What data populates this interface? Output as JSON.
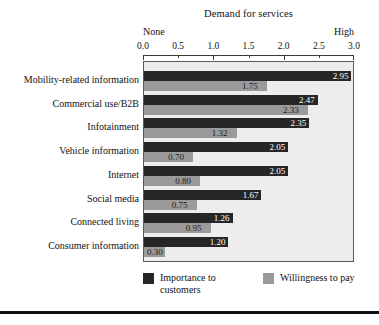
{
  "chart_data": {
    "type": "bar",
    "orientation": "horizontal",
    "title": "Demand for services",
    "xlabel": "",
    "ylabel": "",
    "xlim": [
      0.0,
      3.0
    ],
    "xticks": [
      "0.0",
      "0.5",
      "1.0",
      "1.5",
      "2.0",
      "2.5",
      "3.0"
    ],
    "xtick_values": [
      0.0,
      0.5,
      1.0,
      1.5,
      2.0,
      2.5,
      3.0
    ],
    "scale_low_label": "None",
    "scale_high_label": "High",
    "grid": false,
    "legend_position": "bottom",
    "categories": [
      "Mobility-related information",
      "Commercial use/B2B",
      "Infotainment",
      "Vehicle information",
      "Internet",
      "Social media",
      "Connected living",
      "Consumer information"
    ],
    "series": [
      {
        "name": "Importance to customers",
        "color": "#262626",
        "values": [
          2.95,
          2.47,
          2.35,
          2.05,
          2.05,
          1.67,
          1.26,
          1.2
        ],
        "labels": [
          "2.95",
          "2.47",
          "2.35",
          "2.05",
          "2.05",
          "1.67",
          "1.26",
          "1.20"
        ]
      },
      {
        "name": "Willingness to pay",
        "color": "#9a9a9a",
        "values": [
          1.75,
          2.33,
          1.32,
          0.7,
          0.8,
          0.75,
          0.95,
          0.3
        ],
        "labels": [
          "1.75",
          "2.33",
          "1.32",
          "0.70",
          "0.80",
          "0.75",
          "0.95",
          "0.30"
        ]
      }
    ]
  },
  "legend": {
    "items": [
      {
        "label": "Importance to customers",
        "color": "#262626"
      },
      {
        "label": "Willingness to pay",
        "color": "#9a9a9a"
      }
    ]
  },
  "style": {
    "plot_background": "#ededed",
    "frame_color": "#5a5a5a",
    "page_background": "#ffffff",
    "text_color": "#111111"
  }
}
